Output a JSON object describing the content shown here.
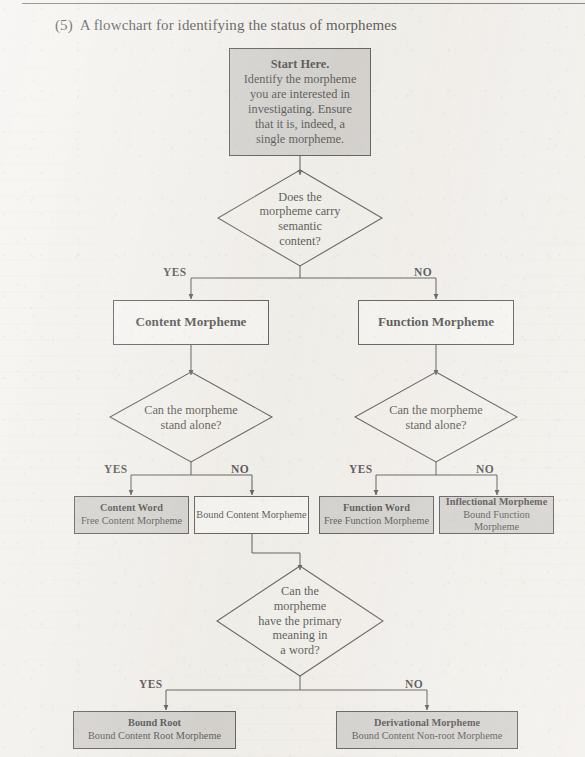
{
  "page": {
    "title_number": "(5)",
    "title_text": "A flowchart for identifying the status of morphemes"
  },
  "colors": {
    "paper": "#f2f0ec",
    "gray_fill": "#c9c7c4",
    "white_fill": "#f7f6f3",
    "stroke": "#2b2b2b",
    "text": "#1a1a1a"
  },
  "flowchart": {
    "start": {
      "heading": "Start Here.",
      "lines": [
        "Identify the morpheme",
        "you are interested in",
        "investigating. Ensure",
        "that it is, indeed, a",
        "single morpheme."
      ]
    },
    "decision_semantic": {
      "lines": [
        "Does the",
        "morpheme carry",
        "semantic",
        "content?"
      ]
    },
    "branch_labels": {
      "yes": "YES",
      "no": "NO"
    },
    "content_morpheme": {
      "label": "Content Morpheme"
    },
    "function_morpheme": {
      "label": "Function Morpheme"
    },
    "decision_stand_alone_left": {
      "lines": [
        "Can the morpheme",
        "stand alone?"
      ]
    },
    "decision_stand_alone_right": {
      "lines": [
        "Can the morpheme",
        "stand alone?"
      ]
    },
    "content_word": {
      "title": "Content Word",
      "subtitle": "Free Content Morpheme"
    },
    "bound_content_morpheme": {
      "title": "Bound Content Morpheme",
      "subtitle": ""
    },
    "function_word": {
      "title": "Function Word",
      "subtitle": "Free Function Morpheme"
    },
    "inflectional_morpheme": {
      "title": "Inflectional Morpheme",
      "subtitle": "Bound Function Morpheme"
    },
    "decision_primary_meaning": {
      "lines": [
        "Can the",
        "morpheme",
        "have the primary",
        "meaning in",
        "a word?"
      ]
    },
    "bound_root": {
      "title": "Bound Root",
      "subtitle": "Bound Content Root Morpheme"
    },
    "derivational_morpheme": {
      "title": "Derivational Morpheme",
      "subtitle": "Bound Content Non-root Morpheme"
    }
  }
}
